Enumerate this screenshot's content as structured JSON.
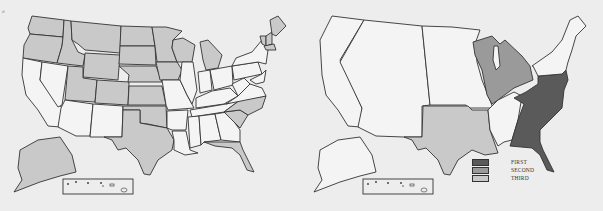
{
  "corner_mark": "d",
  "colors": {
    "background": "#ededed",
    "unshaded": "#f4f4f4",
    "shaded_left": "#c9c9c9",
    "first": "#5a5a5a",
    "second": "#9a9a9a",
    "third": "#c9c9c9",
    "border": "#333333"
  },
  "left_map": {
    "description": "US states map; shaded states in light gray",
    "shaded_states": [
      "Washington",
      "Oregon",
      "Idaho",
      "Montana",
      "Wyoming",
      "Utah",
      "Colorado",
      "North Dakota",
      "South Dakota",
      "Nebraska",
      "Kansas",
      "Oklahoma",
      "Texas",
      "Minnesota",
      "Iowa",
      "Wisconsin",
      "Michigan",
      "North Carolina",
      "South Carolina",
      "Florida",
      "Maine",
      "Vermont",
      "New Hampshire",
      "Massachusetts",
      "Alaska"
    ],
    "inset": "Hawaii"
  },
  "right_map": {
    "description": "US map divided into regions shaded First / Second / Third",
    "regions": {
      "first": "Southeast Atlantic region",
      "second": "Great Lakes region",
      "third": "Texas"
    },
    "inset": "Hawaii"
  },
  "legend": {
    "items": [
      {
        "label": "FIRST",
        "color": "#5a5a5a"
      },
      {
        "label": "SECOND",
        "color": "#9a9a9a"
      },
      {
        "label": "THIRD",
        "color": "#c9c9c9"
      }
    ]
  }
}
